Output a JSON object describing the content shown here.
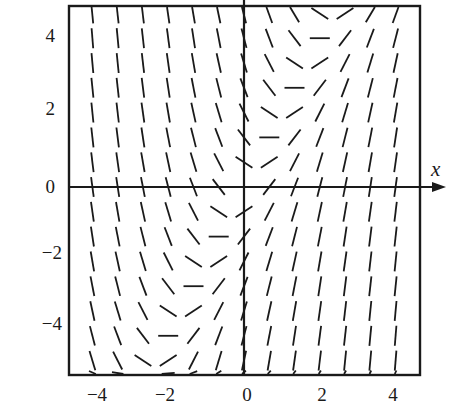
{
  "figure": {
    "x_axis_label": "x",
    "x_tick_labels": [
      "−4",
      "−2",
      "0",
      "2",
      "4"
    ],
    "y_tick_labels": [
      "4",
      "2",
      "0",
      "−2",
      "−4"
    ]
  },
  "chart_data": {
    "type": "slope_field",
    "title": "",
    "xlabel": "x",
    "ylabel": "y",
    "xlim": [
      -4.7,
      4.7
    ],
    "ylim": [
      -5.2,
      4.8
    ],
    "x_ticks": [
      -4,
      -2,
      0,
      2,
      4
    ],
    "y_ticks": [
      4,
      2,
      0,
      -2,
      -4
    ],
    "grid": false,
    "differential_equation": "dy/dx = 2x - y",
    "slope_coefficients": {
      "x": 2,
      "y": -1,
      "const": 0
    },
    "sample_grid": {
      "x_values": [
        -4,
        -3.333,
        -2.667,
        -2,
        -1.333,
        -0.667,
        0,
        0.667,
        1.333,
        2,
        2.667,
        3.333,
        4
      ],
      "y_values": [
        4.667,
        4,
        3.333,
        2.667,
        2,
        1.333,
        0.667,
        0,
        -0.667,
        -1.333,
        -2,
        -2.667,
        -3.333,
        -4,
        -4.667,
        -5.2
      ]
    },
    "zero_slope_isocline": "y = 2x"
  },
  "colors": {
    "ink": "#1a1a1a",
    "background": "#ffffff"
  }
}
